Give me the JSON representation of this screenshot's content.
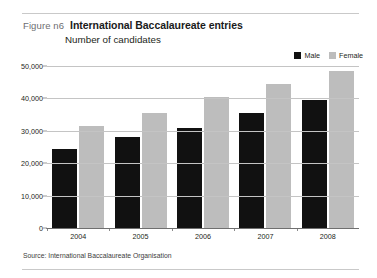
{
  "figure": {
    "number_label": "Figure n6",
    "title": "International Baccalaureate entries",
    "subtitle": "Number of candidates",
    "source": "Source: International Baccalaureate Organisation"
  },
  "colors": {
    "male": "#111111",
    "female": "#bdbdbd",
    "gridline": "#c4c4c4",
    "axis": "#6f6f6f",
    "rule": "#c9c9c9"
  },
  "legend": {
    "position": "top-right",
    "items": [
      {
        "label": "Male",
        "color": "#111111"
      },
      {
        "label": "Female",
        "color": "#bdbdbd"
      }
    ]
  },
  "chart_data": {
    "type": "bar",
    "title": "International Baccalaureate entries",
    "subtitle": "Number of candidates",
    "xlabel": "",
    "ylabel": "Number of candidates",
    "categories": [
      "2004",
      "2005",
      "2006",
      "2007",
      "2008"
    ],
    "series": [
      {
        "name": "Male",
        "color": "#111111",
        "values": [
          24500,
          28000,
          31000,
          35500,
          39500
        ]
      },
      {
        "name": "Female",
        "color": "#bdbdbd",
        "values": [
          31500,
          35500,
          40500,
          44500,
          48500
        ]
      }
    ],
    "ylim": [
      0,
      50000
    ],
    "yticks": [
      0,
      10000,
      20000,
      30000,
      40000,
      50000
    ],
    "ytick_labels": [
      "0",
      "10,000",
      "20,000",
      "30,000",
      "40,000",
      "50,000"
    ],
    "grid": true,
    "legend_position": "top-right",
    "source": "Source: International Baccalaureate Organisation"
  }
}
